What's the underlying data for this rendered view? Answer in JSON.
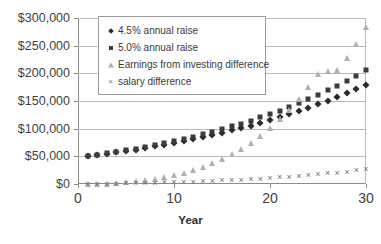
{
  "chart_data": {
    "type": "scatter",
    "title": "",
    "xlabel": "Year",
    "ylabel": "",
    "xlim": [
      0,
      30
    ],
    "ylim": [
      0,
      300000
    ],
    "grid": true,
    "legend_position": "top-left-inside",
    "x_ticks": [
      "0",
      "10",
      "20",
      "30"
    ],
    "x_tick_values": [
      0,
      10,
      20,
      30
    ],
    "y_ticks": [
      "$0",
      "$50,000",
      "$100,000",
      "$150,000",
      "$200,000",
      "$250,000",
      "$300,000"
    ],
    "y_tick_values": [
      0,
      50000,
      100000,
      150000,
      200000,
      250000,
      300000
    ],
    "x": [
      1,
      2,
      3,
      4,
      5,
      6,
      7,
      8,
      9,
      10,
      11,
      12,
      13,
      14,
      15,
      16,
      17,
      18,
      19,
      20,
      21,
      22,
      23,
      24,
      25,
      26,
      27,
      28,
      29,
      30
    ],
    "series": [
      {
        "name": "4.5% annual raise",
        "marker": "diamond",
        "color": "#2b2b2b",
        "values": [
          50000,
          52250,
          54601,
          57058,
          59626,
          62309,
          65113,
          68043,
          71105,
          74305,
          77649,
          81143,
          84795,
          88611,
          92599,
          96766,
          101121,
          105671,
          110427,
          115396,
          120589,
          126015,
          131686,
          137612,
          143804,
          150275,
          157038,
          164104,
          171489,
          179206
        ]
      },
      {
        "name": "5.0% annual raise",
        "marker": "square",
        "color": "#3b3b3b",
        "values": [
          50000,
          52500,
          55125,
          57881,
          60775,
          63814,
          67005,
          70355,
          73873,
          77566,
          81444,
          85516,
          89792,
          94282,
          98996,
          103946,
          109143,
          114601,
          120331,
          126347,
          132665,
          139298,
          146263,
          153576,
          161255,
          169318,
          177784,
          186673,
          196007,
          205807
        ]
      },
      {
        "name": "Earnings from investing difference",
        "marker": "triangle",
        "color": "#b0b0b0",
        "values": [
          0,
          265,
          820,
          1700,
          2940,
          4580,
          6660,
          9230,
          12330,
          16020,
          20360,
          25410,
          31240,
          37930,
          45550,
          54200,
          63970,
          74980,
          87340,
          101180,
          116640,
          133880,
          153070,
          174400,
          198080,
          205000,
          205500,
          228000,
          253000,
          283000
        ]
      },
      {
        "name": "salary difference",
        "marker": "cross",
        "color": "#6e6e6e",
        "values": [
          0,
          250,
          524,
          823,
          1149,
          1505,
          1892,
          2312,
          2768,
          3261,
          3795,
          4373,
          4997,
          5671,
          6397,
          7180,
          8022,
          8930,
          9904,
          10951,
          12076,
          13283,
          14577,
          15964,
          17451,
          19043,
          20746,
          22569,
          24518,
          26601
        ]
      }
    ]
  },
  "axis": {
    "x_title": "Year"
  }
}
